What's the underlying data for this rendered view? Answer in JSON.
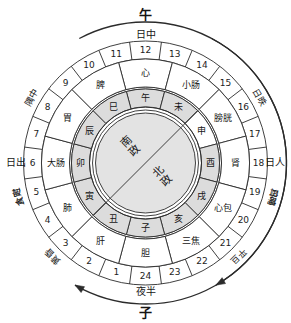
{
  "diagram": {
    "title_top_big": "午",
    "title_top_sub": "日中",
    "title_bottom_sub": "夜半",
    "title_bottom_big": "子",
    "label_left": "日出",
    "label_right": "日人",
    "center": {
      "upper": "南政",
      "lower": "北政"
    },
    "colors": {
      "stroke": "#2b2b2b",
      "shade_fill": "#dcdcdc",
      "center_fill": "#e3e3e3",
      "page_bg": "#ffffff"
    },
    "outer_period_labels": [
      {
        "text": "隅中",
        "angle_deg": -60
      },
      {
        "text": "食时",
        "angle_deg": -105
      },
      {
        "text": "平旦",
        "angle_deg": -225
      },
      {
        "text": "鸡鸣",
        "angle_deg": -255
      },
      {
        "text": "日昳",
        "angle_deg": 60
      },
      {
        "text": "日晡",
        "angle_deg": 105
      },
      {
        "text": "黄昏",
        "angle_deg": 225
      },
      {
        "text": "人定",
        "angle_deg": 255
      }
    ],
    "hour_numbers": [
      "1",
      "2",
      "3",
      "4",
      "5",
      "6",
      "7",
      "8",
      "9",
      "10",
      "11",
      "12",
      "13",
      "14",
      "15",
      "16",
      "17",
      "18",
      "19",
      "20",
      "21",
      "22",
      "23",
      "24"
    ],
    "organs": [
      {
        "name": "心",
        "hours": "11-13"
      },
      {
        "name": "小肠",
        "hours": "13-15"
      },
      {
        "name": "膀胱",
        "hours": "15-17"
      },
      {
        "name": "肾",
        "hours": "17-19"
      },
      {
        "name": "心包",
        "hours": "19-21"
      },
      {
        "name": "三焦",
        "hours": "21-23"
      },
      {
        "name": "胆",
        "hours": "23-1"
      },
      {
        "name": "肝",
        "hours": "1-3"
      },
      {
        "name": "肺",
        "hours": "3-5"
      },
      {
        "name": "大肠",
        "hours": "5-7"
      },
      {
        "name": "胃",
        "hours": "7-9"
      },
      {
        "name": "脾",
        "hours": "9-11"
      }
    ],
    "branches": [
      {
        "name": "午",
        "shaded": true
      },
      {
        "name": "未",
        "shaded": true
      },
      {
        "name": "申",
        "shaded": false
      },
      {
        "name": "酉",
        "shaded": true
      },
      {
        "name": "戌",
        "shaded": true
      },
      {
        "name": "亥",
        "shaded": true
      },
      {
        "name": "子",
        "shaded": true
      },
      {
        "name": "丑",
        "shaded": true
      },
      {
        "name": "寅",
        "shaded": true
      },
      {
        "name": "卯",
        "shaded": true
      },
      {
        "name": "辰",
        "shaded": true
      },
      {
        "name": "巳",
        "shaded": true
      }
    ]
  }
}
